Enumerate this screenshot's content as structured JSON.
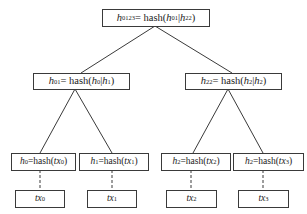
{
  "diagram": {
    "type": "merkle-tree",
    "root": {
      "var": "h",
      "var_sub": "0123",
      "eq": "= hash(",
      "a": "h",
      "a_sub": "01",
      "sep": "|",
      "b": "h",
      "b_sub": "22",
      "close": ")"
    },
    "level2": [
      {
        "var": "h",
        "var_sub": "01",
        "eq": "= hash(",
        "a": "h",
        "a_sub": "0",
        "sep": "|",
        "b": "h",
        "b_sub": "1",
        "close": ")"
      },
      {
        "var": "h",
        "var_sub": "22",
        "eq": "= hash(",
        "a": "h",
        "a_sub": "2",
        "sep": "|",
        "b": "h",
        "b_sub": "2",
        "close": ")"
      }
    ],
    "leaves": [
      {
        "var": "h",
        "var_sub": "0",
        "eq": "=hash(",
        "arg": "tx",
        "arg_sub": "0",
        "close": ")"
      },
      {
        "var": "h",
        "var_sub": "1",
        "eq": "=hash(",
        "arg": "tx",
        "arg_sub": "1",
        "close": ")"
      },
      {
        "var": "h",
        "var_sub": "2",
        "eq": "=hash(",
        "arg": "tx",
        "arg_sub": "2",
        "close": ")"
      },
      {
        "var": "h",
        "var_sub": "2",
        "eq": "=hash(",
        "arg": "tx",
        "arg_sub": "3",
        "close": ")"
      }
    ],
    "transactions": [
      {
        "label": "tx",
        "sub": "0"
      },
      {
        "label": "tx",
        "sub": "1"
      },
      {
        "label": "tx",
        "sub": "2"
      },
      {
        "label": "tx",
        "sub": "3"
      }
    ],
    "colors": {
      "line": "#3a3a3a",
      "box_border": "#3a3a3a",
      "background": "#ffffff",
      "text": "#1a1a1a"
    }
  }
}
